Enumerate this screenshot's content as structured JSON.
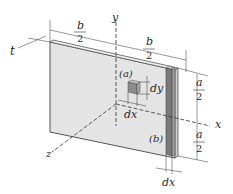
{
  "diagram": {
    "labels": {
      "t": "t",
      "b_top_left_num": "b",
      "b_top_left_den": "2",
      "b_top_right_num": "b",
      "b_top_right_den": "2",
      "y_axis": "y",
      "x_axis": "x",
      "z_axis": "z",
      "region_a": "(a)",
      "region_b": "(b)",
      "dy": "dy",
      "dx_inner": "dx",
      "dx_bottom": "dx",
      "a_upper_num": "a",
      "a_upper_den": "2",
      "a_lower_num": "a",
      "a_lower_den": "2"
    },
    "colors": {
      "plate_face": "#e4e4e4",
      "plate_edge": "#555555",
      "strip_dark": "#7a7a7a",
      "strip_mid": "#9a9a9a",
      "strip_light": "#cfcfcf",
      "element_front": "#8c8c8c",
      "element_top": "#c8c8c8",
      "line": "#333333"
    }
  }
}
